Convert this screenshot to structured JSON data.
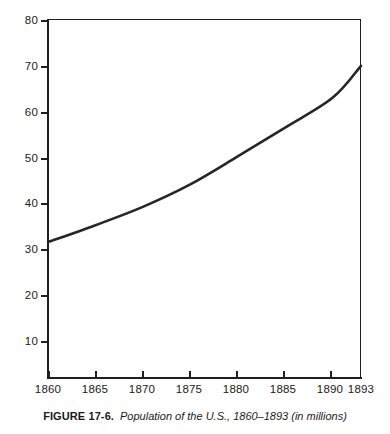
{
  "figure": {
    "caption_label": "FIGURE 17-6.",
    "caption_title": "Population of the U.S., 1860–1893 (in millions)"
  },
  "chart_data": {
    "type": "line",
    "title": "Population of the U.S., 1860–1893 (in millions)",
    "xlabel": "",
    "ylabel": "",
    "xlim": [
      1860,
      1893
    ],
    "ylim": [
      0,
      80
    ],
    "grid": false,
    "legend": null,
    "line_color": "#262626",
    "line_width": 2.6,
    "x_ticks": [
      1860,
      1865,
      1870,
      1875,
      1880,
      1885,
      1890,
      1893
    ],
    "x_tick_labels": [
      "1860",
      "1865",
      "1870",
      "1875",
      "1880",
      "1885",
      "1890",
      "1893"
    ],
    "y_ticks": [
      10,
      20,
      30,
      40,
      50,
      60,
      70,
      80
    ],
    "y_tick_labels": [
      "10",
      "20",
      "30",
      "40",
      "50",
      "60",
      "70",
      "80"
    ],
    "series": [
      {
        "name": "Population (millions)",
        "x": [
          1860,
          1865,
          1870,
          1875,
          1880,
          1885,
          1890,
          1893
        ],
        "values": [
          31.5,
          35.2,
          39.2,
          44.1,
          50.2,
          56.5,
          63.0,
          70.0
        ]
      }
    ]
  }
}
